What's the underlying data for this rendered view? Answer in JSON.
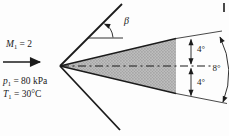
{
  "figure": {
    "labels": {
      "mach": {
        "sym": "M",
        "sub": "1",
        "val": " = 2"
      },
      "pressure": {
        "sym": "p",
        "sub": "1",
        "val": " = 80 kPa"
      },
      "temperature": {
        "sym": "T",
        "sub": "1",
        "val": " = 30°C"
      },
      "beta": "β",
      "upper_half_angle": "4°",
      "lower_half_angle": "4°",
      "total_angle": "8°"
    },
    "icons": {
      "free_stream_arrow": "right-arrow",
      "beta_arc": "angle-arc-arrow",
      "dimension_arrows": "double-headed-arrow"
    },
    "colors": {
      "line": "#1b1b1b",
      "wedge_fill_base": "#bcbcbc",
      "wedge_fill_dot": "#8e8e8e",
      "background": "#fdfdfd"
    }
  }
}
